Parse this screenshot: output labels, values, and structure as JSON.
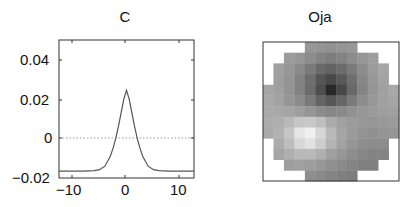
{
  "chart_data": [
    {
      "type": "line",
      "title": "C",
      "xlabel": "",
      "ylabel": "",
      "xlim": [
        -12.5,
        12.5
      ],
      "ylim": [
        -0.02,
        0.05
      ],
      "xticks": [
        -10,
        0,
        10
      ],
      "xtick_labels": [
        "−10",
        "0",
        "10"
      ],
      "yticks": [
        -0.02,
        0,
        0.02,
        0.04
      ],
      "ytick_labels": [
        "−0.02",
        "0",
        "0.02",
        "0.04"
      ],
      "grid": false,
      "reference_line": {
        "y": 0,
        "style": "dotted"
      },
      "series": [
        {
          "name": "C",
          "x": [
            -12.5,
            -10,
            -8,
            -6,
            -5,
            -4,
            -3,
            -2.5,
            -2,
            -1.5,
            -1,
            -0.5,
            0,
            0.5,
            1,
            1.5,
            2,
            2.5,
            3,
            4,
            5,
            6,
            8,
            10,
            12.5
          ],
          "y": [
            -0.0165,
            -0.0165,
            -0.0165,
            -0.0163,
            -0.0158,
            -0.014,
            -0.009,
            -0.005,
            0.0,
            0.006,
            0.013,
            0.02,
            0.0245,
            0.02,
            0.013,
            0.006,
            0.0,
            -0.005,
            -0.009,
            -0.014,
            -0.0158,
            -0.0163,
            -0.0165,
            -0.0165,
            -0.0165
          ]
        }
      ]
    },
    {
      "type": "heatmap",
      "title": "Oja",
      "colormap": "gray",
      "rows": 13,
      "cols": 13,
      "mask": "circular",
      "values": [
        [
          null,
          null,
          null,
          null,
          150,
          148,
          145,
          148,
          152,
          null,
          null,
          null,
          null
        ],
        [
          null,
          null,
          155,
          150,
          140,
          132,
          125,
          130,
          140,
          150,
          158,
          null,
          null
        ],
        [
          null,
          160,
          150,
          138,
          122,
          105,
          98,
          108,
          122,
          140,
          155,
          165,
          null
        ],
        [
          null,
          158,
          148,
          130,
          110,
          85,
          72,
          88,
          110,
          135,
          152,
          163,
          null
        ],
        [
          165,
          160,
          148,
          130,
          108,
          78,
          40,
          72,
          105,
          132,
          150,
          160,
          168
        ],
        [
          168,
          162,
          150,
          140,
          122,
          100,
          88,
          102,
          122,
          140,
          152,
          160,
          165
        ],
        [
          170,
          168,
          165,
          158,
          150,
          140,
          135,
          138,
          145,
          150,
          155,
          158,
          160
        ],
        [
          172,
          175,
          185,
          198,
          200,
          190,
          170,
          160,
          155,
          152,
          150,
          152,
          155
        ],
        [
          170,
          178,
          198,
          230,
          240,
          215,
          185,
          165,
          155,
          148,
          145,
          148,
          150
        ],
        [
          null,
          172,
          190,
          215,
          225,
          205,
          180,
          162,
          150,
          142,
          140,
          140,
          null
        ],
        [
          null,
          165,
          175,
          185,
          185,
          175,
          160,
          150,
          142,
          135,
          132,
          132,
          null
        ],
        [
          null,
          null,
          158,
          160,
          158,
          152,
          145,
          138,
          132,
          128,
          128,
          null,
          null
        ],
        [
          null,
          null,
          null,
          null,
          142,
          138,
          132,
          128,
          125,
          null,
          null,
          null,
          null
        ]
      ]
    }
  ],
  "panels": {
    "left": {
      "title": "C",
      "yticks": [
        "0.04",
        "0.02",
        "0",
        "−0.02"
      ],
      "xticks": [
        "−10",
        "0",
        "10"
      ]
    },
    "right": {
      "title": "Oja"
    }
  }
}
